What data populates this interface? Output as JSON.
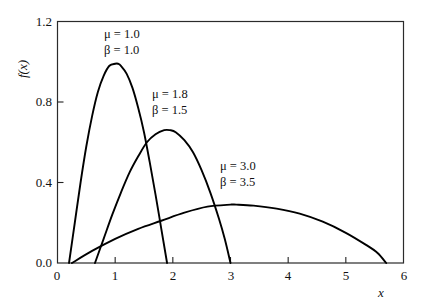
{
  "chart_data": {
    "type": "line",
    "title": "",
    "xlabel": "x",
    "ylabel": "f(x)",
    "xlim": [
      0,
      6
    ],
    "ylim": [
      0,
      1.2
    ],
    "grid": false,
    "legend_position": "inline-annotations",
    "xticks": [
      "0",
      "1",
      "2",
      "3",
      "4",
      "5",
      "6"
    ],
    "xtick_values": [
      0,
      1,
      2,
      3,
      4,
      5,
      6
    ],
    "yticks": [
      "0.0",
      "0.4",
      "0.8",
      "1.2"
    ],
    "ytick_values": [
      0.0,
      0.4,
      0.8,
      1.2
    ],
    "line_color": "#000000",
    "axis_color": "#222222",
    "series": [
      {
        "name": "mu = 1.0, beta = 1.0",
        "mu_label": "μ = 1.0",
        "beta_label": "β = 1.0",
        "mu": 1.0,
        "beta": 1.0,
        "support": [
          0.2,
          1.9
        ],
        "peak_x": 1.05,
        "peak_y": 0.99,
        "x": [
          0.2,
          0.3,
          0.4,
          0.5,
          0.6,
          0.7,
          0.8,
          0.9,
          1.0,
          1.05,
          1.1,
          1.2,
          1.3,
          1.4,
          1.5,
          1.6,
          1.7,
          1.8,
          1.9
        ],
        "y": [
          0.0,
          0.2,
          0.4,
          0.58,
          0.73,
          0.85,
          0.93,
          0.98,
          0.99,
          0.99,
          0.98,
          0.94,
          0.87,
          0.77,
          0.65,
          0.5,
          0.34,
          0.17,
          0.0
        ]
      },
      {
        "name": "mu = 1.8, beta = 1.5",
        "mu_label": "μ = 1.8",
        "beta_label": "β = 1.5",
        "mu": 1.8,
        "beta": 1.5,
        "support": [
          0.65,
          3.0
        ],
        "peak_x": 1.95,
        "peak_y": 0.66,
        "x": [
          0.65,
          0.8,
          0.95,
          1.1,
          1.25,
          1.4,
          1.55,
          1.7,
          1.85,
          1.95,
          2.05,
          2.2,
          2.35,
          2.5,
          2.65,
          2.8,
          2.9,
          3.0
        ],
        "y": [
          0.0,
          0.12,
          0.24,
          0.35,
          0.45,
          0.53,
          0.6,
          0.64,
          0.66,
          0.66,
          0.65,
          0.61,
          0.55,
          0.46,
          0.35,
          0.22,
          0.12,
          0.0
        ]
      },
      {
        "name": "mu = 3.0, beta = 3.5",
        "mu_label": "μ = 3.0",
        "beta_label": "β = 3.5",
        "mu": 3.0,
        "beta": 3.5,
        "support": [
          0.25,
          5.7
        ],
        "peak_x": 3.1,
        "peak_y": 0.29,
        "x": [
          0.25,
          0.6,
          1.0,
          1.4,
          1.8,
          2.2,
          2.6,
          3.0,
          3.1,
          3.4,
          3.8,
          4.2,
          4.6,
          5.0,
          5.35,
          5.55,
          5.7
        ],
        "y": [
          0.0,
          0.06,
          0.12,
          0.17,
          0.21,
          0.25,
          0.28,
          0.29,
          0.29,
          0.285,
          0.27,
          0.245,
          0.205,
          0.15,
          0.09,
          0.05,
          0.0
        ]
      }
    ]
  },
  "axis": {
    "x_title": "x",
    "y_title": "f(x)"
  }
}
